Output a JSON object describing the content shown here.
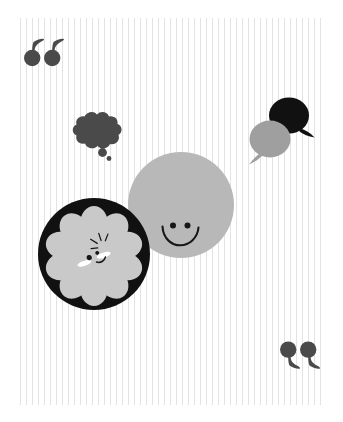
{
  "artwork": {
    "title": "Speech and thought bubble illustration",
    "background": {
      "name": "vertical-striped-panel",
      "base_color": "#ffffff",
      "stripe_color": "#e3e3e3",
      "stripe_pitch_px": 6,
      "stripe_width_px": 1.4,
      "panel_inset": {
        "left": 20,
        "top": 18,
        "right": 18,
        "bottom": 17
      }
    },
    "palette": {
      "black": "#111111",
      "dark_gray": "#4a4a4a",
      "mid_gray": "#9f9f9f",
      "light_gray": "#b8b8b8",
      "flower_gray": "#c9c9c9",
      "white": "#ffffff"
    },
    "elements": [
      {
        "name": "opening-quotation-marks",
        "glyph": "66",
        "label": "Opening quote",
        "color": "#4a4a4a",
        "position": {
          "x": 22,
          "y": 36
        }
      },
      {
        "name": "closing-quotation-marks",
        "glyph": "99",
        "label": "Closing quote",
        "color": "#4a4a4a",
        "position": {
          "x": 278,
          "y": 338
        }
      },
      {
        "name": "thought-bubble",
        "label": "Thought bubble cloud",
        "color": "#4a4a4a",
        "trailing_dots": 2,
        "position": {
          "x": 66,
          "y": 110
        }
      },
      {
        "name": "speech-bubble-black",
        "label": "Black speech bubble",
        "color": "#111111",
        "tail": "bottom-right",
        "position": {
          "x": 266,
          "y": 96
        }
      },
      {
        "name": "speech-bubble-gray",
        "label": "Gray speech bubble",
        "color": "#9f9f9f",
        "tail": "bottom-left",
        "position": {
          "x": 243,
          "y": 119
        }
      },
      {
        "name": "smiley-circle",
        "label": "Gray smiling circle",
        "color": "#b8b8b8",
        "face": {
          "eyes": 2,
          "mouth": "smile"
        },
        "radius": 54,
        "position": {
          "x": 127,
          "y": 151
        }
      },
      {
        "name": "flower-in-black-circle",
        "label": "Light gray flower face on black circle",
        "circle_color": "#111111",
        "flower_color": "#c9c9c9",
        "petals": 10,
        "face": {
          "eyes": 2,
          "blush": 2,
          "mouth": "smile",
          "sparkle": 1
        },
        "radius": 57,
        "position": {
          "x": 37,
          "y": 197
        }
      }
    ]
  }
}
